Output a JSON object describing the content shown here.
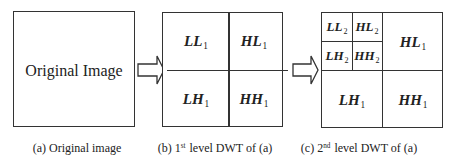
{
  "panels": [
    {
      "id": "a",
      "box_label": "Original Image",
      "caption": {
        "prefix": "(a) Original image",
        "ordinal_num": "",
        "ordinal_sup": "",
        "suffix": ""
      }
    },
    {
      "id": "b",
      "subbands": [
        {
          "name": "LL",
          "level": "1"
        },
        {
          "name": "HL",
          "level": "1"
        },
        {
          "name": "LH",
          "level": "1"
        },
        {
          "name": "HH",
          "level": "1"
        }
      ],
      "caption": {
        "prefix": "(b) ",
        "ordinal_num": "1",
        "ordinal_sup": "st",
        "suffix": " level DWT of (a)"
      }
    },
    {
      "id": "c",
      "subbands": [
        {
          "name": "LL",
          "level": "2"
        },
        {
          "name": "HL",
          "level": "2"
        },
        {
          "name": "LH",
          "level": "2"
        },
        {
          "name": "HH",
          "level": "2"
        },
        {
          "name": "HL",
          "level": "1"
        },
        {
          "name": "LH",
          "level": "1"
        },
        {
          "name": "HH",
          "level": "1"
        }
      ],
      "caption": {
        "prefix": "(c) ",
        "ordinal_num": "2",
        "ordinal_sup": "nd",
        "suffix": " level DWT of (a)"
      }
    }
  ],
  "arrows": [
    {
      "from": "a",
      "to": "b",
      "icon": "right-block-arrow-icon"
    },
    {
      "from": "b",
      "to": "c",
      "icon": "right-block-arrow-icon"
    }
  ],
  "colors": {
    "stroke": "#333333",
    "text": "#222222",
    "background": "#ffffff"
  }
}
